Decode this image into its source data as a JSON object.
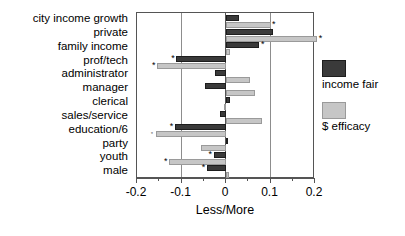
{
  "chart_data": {
    "type": "bar",
    "orientation": "horizontal",
    "title": "",
    "xlabel": "Less/More",
    "ylabel": "",
    "xlim": [
      -0.2,
      0.2
    ],
    "xticks": [
      -0.2,
      -0.1,
      0,
      0.1,
      0.2
    ],
    "xticklabels": [
      "-0.2",
      "-0.1",
      "0",
      "0.1",
      "0.2"
    ],
    "grid": "vertical gridlines at -0.1 and 0.1, zero line at 0",
    "legend_position": "right",
    "categories": [
      "city income growth",
      "private",
      "family income",
      "prof/tech",
      "administrator",
      "manager",
      "clerical",
      "sales/service",
      "education/6",
      "party",
      "youth",
      "male"
    ],
    "series": [
      {
        "name": "income fair",
        "color": "#3a3a3a",
        "values": [
          0.03,
          0.105,
          0.075,
          -0.112,
          -0.025,
          -0.048,
          0.008,
          -0.013,
          -0.115,
          0.004,
          -0.028,
          -0.043
        ]
      },
      {
        "name": "$ efficacy",
        "color": "#c6c6c6",
        "values": [
          0.1,
          0.205,
          0.008,
          -0.155,
          0.055,
          0.065,
          -0.005,
          0.082,
          -0.158,
          -0.057,
          -0.128,
          0.006
        ]
      }
    ],
    "significance_markers": [
      {
        "category": "city income growth",
        "series": "$ efficacy",
        "marker": "*"
      },
      {
        "category": "private",
        "series": "$ efficacy",
        "marker": "*"
      },
      {
        "category": "family income",
        "series": "income fair",
        "marker": "*"
      },
      {
        "category": "prof/tech",
        "series": "income fair",
        "marker": "*"
      },
      {
        "category": "prof/tech",
        "series": "$ efficacy",
        "marker": "*"
      },
      {
        "category": "education/6",
        "series": "income fair",
        "marker": "*"
      },
      {
        "category": "education/6",
        "series": "$ efficacy",
        "marker": "o"
      },
      {
        "category": "youth",
        "series": "income fair",
        "marker": "*"
      },
      {
        "category": "youth",
        "series": "$ efficacy",
        "marker": "*"
      },
      {
        "category": "male",
        "series": "income fair",
        "marker": "*"
      }
    ]
  },
  "axis": {
    "xlabel": "Less/More",
    "ticklabels": [
      "-0.2",
      "-0.1",
      "0",
      "0.1",
      "0.2"
    ]
  },
  "legend": {
    "items": [
      {
        "label": "income fair",
        "color": "#3a3a3a"
      },
      {
        "label": "$ efficacy",
        "color": "#c6c6c6"
      }
    ]
  }
}
